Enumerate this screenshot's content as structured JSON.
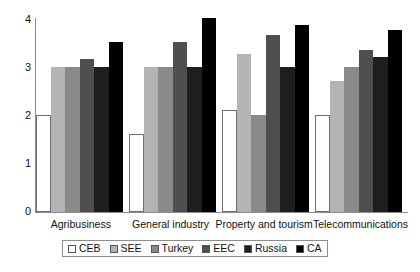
{
  "chart_data": {
    "type": "bar",
    "title": "",
    "subtitle": "",
    "xlabel": "",
    "ylabel": "",
    "ylim": [
      0,
      4
    ],
    "yticks": [
      "0",
      "1",
      "2",
      "3",
      "4"
    ],
    "grid": false,
    "legend_position": "bottom",
    "categories": [
      "Agribusiness",
      "General industry",
      "Property and tourism",
      "Telecommunications"
    ],
    "series": [
      {
        "name": "CEB",
        "color": "#ffffff",
        "values": [
          2.0,
          1.6,
          2.1,
          2.0
        ]
      },
      {
        "name": "SEE",
        "color": "#b4b4b4",
        "values": [
          3.0,
          3.0,
          3.25,
          2.7
        ]
      },
      {
        "name": "Turkey",
        "color": "#8a8a8a",
        "values": [
          3.0,
          3.0,
          2.0,
          3.0
        ]
      },
      {
        "name": "EEC",
        "color": "#4f4f4f",
        "values": [
          3.15,
          3.5,
          3.65,
          3.35
        ]
      },
      {
        "name": "Russia",
        "color": "#1e1e1e",
        "values": [
          3.0,
          3.0,
          3.0,
          3.2
        ]
      },
      {
        "name": "CA",
        "color": "#000000",
        "values": [
          3.5,
          4.0,
          3.85,
          3.75
        ]
      }
    ]
  }
}
